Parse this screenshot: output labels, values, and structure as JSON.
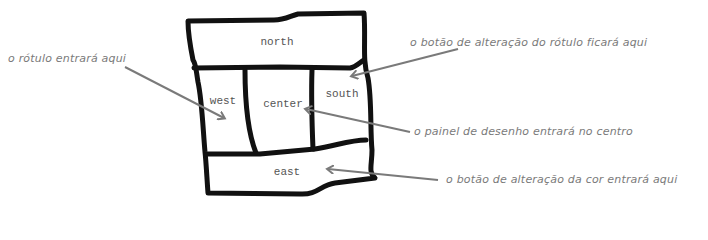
{
  "diagram": {
    "regions": {
      "north": "north",
      "west": "west",
      "center": "center",
      "south": "south",
      "east": "east"
    },
    "annotations": [
      {
        "id": "label",
        "text": "o rótulo entrará aqui",
        "points_to": "west"
      },
      {
        "id": "label-change-button",
        "text": "o botão de alteração do rótulo ficará aqui",
        "points_to": "south"
      },
      {
        "id": "drawing-panel",
        "text": "o painel de desenho entrará no centro",
        "points_to": "center"
      },
      {
        "id": "color-change-button",
        "text": "o botão de alteração da cor entrará aqui",
        "points_to": "east"
      }
    ],
    "colors": {
      "outline": "#111111",
      "arrow": "#7a7a7a",
      "region_text": "#555555",
      "note_text": "#7a7a7a",
      "background": "#ffffff"
    }
  }
}
